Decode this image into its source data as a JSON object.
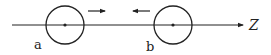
{
  "diagram": {
    "axis": {
      "label": "Z",
      "y": 25,
      "x_start": 12,
      "x_end": 243
    },
    "objects": [
      {
        "id": "a",
        "label": "a",
        "cx": 65,
        "cy": 25,
        "r": 19,
        "velocity_direction": "right"
      },
      {
        "id": "b",
        "label": "b",
        "cx": 173,
        "cy": 25,
        "r": 19,
        "velocity_direction": "left"
      }
    ],
    "arrows": [
      {
        "name": "velocity-arrow-a",
        "direction": "right",
        "x1": 88,
        "x2": 105,
        "y": 11
      },
      {
        "name": "velocity-arrow-b",
        "direction": "left",
        "x1": 150,
        "x2": 133,
        "y": 11
      }
    ],
    "colors": {
      "stroke": "#222222",
      "background": "#ffffff"
    }
  }
}
